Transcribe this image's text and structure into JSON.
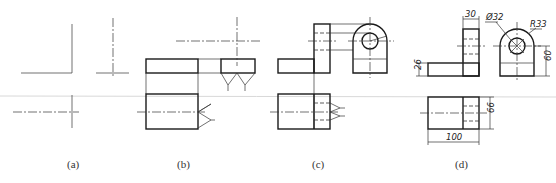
{
  "figure": {
    "type": "orthographic-projection-steps",
    "panels": [
      {
        "id": "a",
        "label": "(a)",
        "description": "Reference axes / centerlines for three views"
      },
      {
        "id": "b",
        "label": "(b)",
        "description": "Base plate blocked in across three views"
      },
      {
        "id": "c",
        "label": "(c)",
        "description": "Upright with bore and rounded top added"
      },
      {
        "id": "d",
        "label": "(d)",
        "description": "Finished drawing with dimensions"
      }
    ],
    "dimensions": {
      "width_top": "30",
      "hole_diameter": "Ø32",
      "radius": "R33",
      "height_right": "60",
      "base_thickness": "26",
      "depth": "66",
      "length": "100"
    }
  }
}
